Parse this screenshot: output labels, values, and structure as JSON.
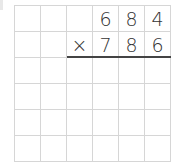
{
  "problem": {
    "multiplicand": [
      "6",
      "8",
      "4"
    ],
    "operator": "×",
    "multiplier": [
      "7",
      "8",
      "6"
    ]
  },
  "grid": {
    "rows": 6,
    "cols": 6,
    "cells": [
      [
        "",
        "",
        "",
        "6",
        "8",
        "4"
      ],
      [
        "",
        "",
        "×",
        "7",
        "8",
        "6"
      ],
      [
        "",
        "",
        "",
        "",
        "",
        ""
      ],
      [
        "",
        "",
        "",
        "",
        "",
        ""
      ],
      [
        "",
        "",
        "",
        "",
        "",
        ""
      ],
      [
        "",
        "",
        "",
        "",
        "",
        ""
      ]
    ]
  }
}
